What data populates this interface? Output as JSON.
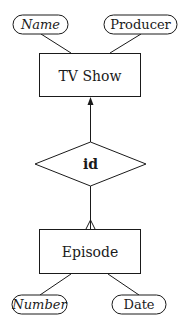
{
  "diagram": {
    "type": "entity-relationship",
    "stroke_color": "#1a1a1a",
    "background": "#ffffff",
    "entities": [
      {
        "id": "tvshow",
        "label": "TV Show"
      },
      {
        "id": "episode",
        "label": "Episode"
      }
    ],
    "relationships": [
      {
        "id": "id_rel",
        "label": "id",
        "from": "episode",
        "to": "tvshow",
        "from_cardinality": "many (crow's foot)",
        "to_cardinality": "one (arrow)"
      }
    ],
    "attributes": [
      {
        "id": "name",
        "label": "Name",
        "entity": "tvshow",
        "key": true
      },
      {
        "id": "producer",
        "label": "Producer",
        "entity": "tvshow",
        "key": false
      },
      {
        "id": "number",
        "label": "Number",
        "entity": "episode",
        "key": true
      },
      {
        "id": "date",
        "label": "Date",
        "entity": "episode",
        "key": false
      }
    ]
  }
}
